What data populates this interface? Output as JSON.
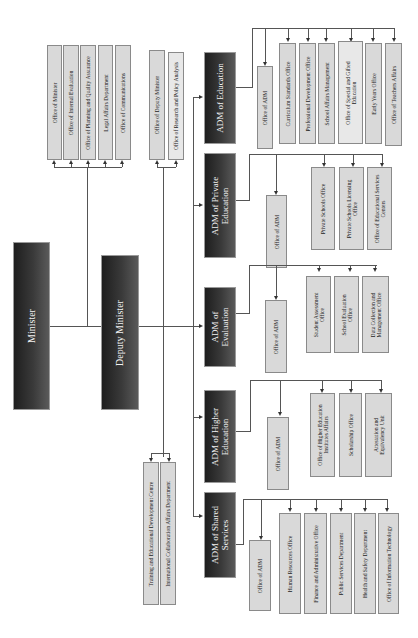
{
  "chart": {
    "minister": "Minister",
    "deputy_minister": "Deputy Minister",
    "minister_offices": [
      "Office of Minister",
      "Office of Internal Evaluation",
      "Office of Planning and Quality Assurance",
      "Legal Affairs Department",
      "Office of Communications"
    ],
    "deputy_offices": [
      "Office of Deputy Minister",
      "Office of Research and Policy Analysis"
    ],
    "deputy_lower_offices": [
      "Training and Educational Development Centre",
      "International Collaboration Affairs Department"
    ],
    "adms": [
      {
        "title": "ADM of Education",
        "office": "Office of ADM",
        "units": [
          "Curriculum Standards Office",
          "Professional Development Office",
          "School Affairs Management",
          "Office of Special and Gifted Education",
          "Early Years Office",
          "Office of Teachers Affairs"
        ]
      },
      {
        "title": "ADM of Private Education",
        "office": "Office of ADM",
        "units": [
          "Private Schools Office",
          "Private Schools Licensing Office",
          "Office of Educational Services Centers"
        ]
      },
      {
        "title": "ADM of Evaluation",
        "office": "Office of ADM",
        "units": [
          "Student Assessment Office",
          "School Evaluation Office",
          "Data Collection and Management Office"
        ]
      },
      {
        "title": "ADM of Higher Education",
        "office": "Office of ADM",
        "units": [
          "Office of Higher Education Institutes Affairs",
          "Scholarship Office",
          "Attestation and Equivalency Unit"
        ]
      },
      {
        "title": "ADM of Shared Services",
        "office": "Office of ADM",
        "units": [
          "Human Resources Office",
          "Finance and Administrative Office",
          "Public Services Department",
          "Health and Safety Department",
          "Office of Information Technology"
        ]
      }
    ]
  }
}
